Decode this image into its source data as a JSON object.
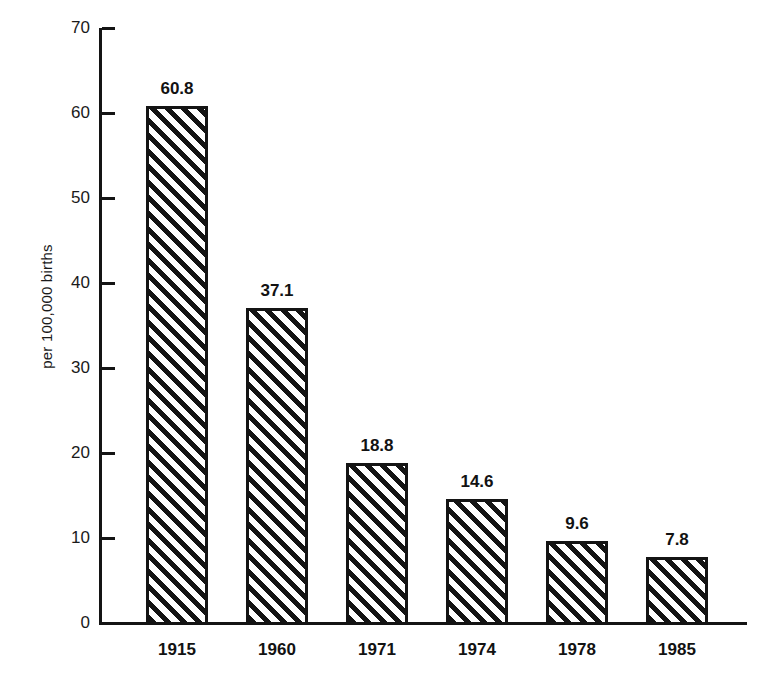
{
  "chart_data": {
    "type": "bar",
    "title": "",
    "subtitle": "",
    "xlabel": "",
    "ylabel": "per 100,000 births",
    "categories": [
      "1915",
      "1960",
      "1971",
      "1974",
      "1978",
      "1985"
    ],
    "values": [
      60.8,
      37.1,
      18.8,
      14.6,
      9.6,
      7.8
    ],
    "value_labels": [
      "60.8",
      "37.1",
      "18.8",
      "14.6",
      "9.6",
      "7.8"
    ],
    "ylim": [
      0,
      70
    ],
    "ytick_labels": [
      "0",
      "10",
      "20",
      "30",
      "40",
      "50",
      "60",
      "70"
    ],
    "ytick_values": [
      0,
      10,
      20,
      30,
      40,
      50,
      60,
      70
    ],
    "grid": false,
    "legend": null,
    "bar_fill": "diagonal-hatch",
    "colors": {
      "ink": "#141414",
      "background": "#ffffff",
      "bar_fill": "#ffffff",
      "bar_edge": "#141414"
    }
  }
}
